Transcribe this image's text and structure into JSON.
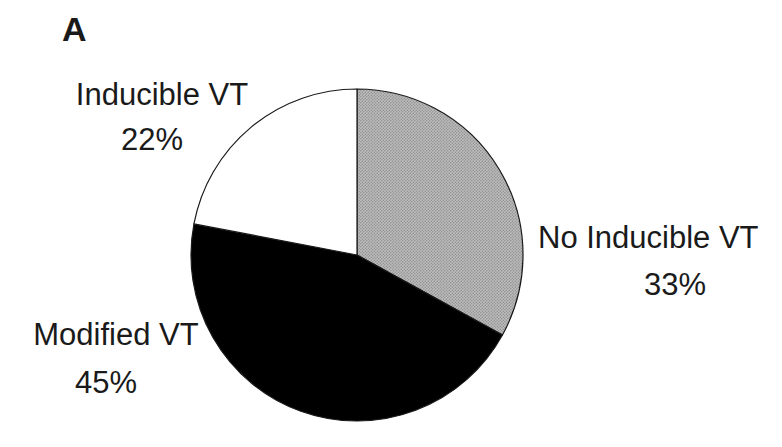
{
  "panel": {
    "label": "A"
  },
  "chart_data": {
    "type": "pie",
    "title": "",
    "direction": "clockwise",
    "start_angle_deg": 0,
    "slices": [
      {
        "label": "No Inducible VT",
        "value": 33,
        "pct_label": "33%",
        "color": "#b0b0b0",
        "fill_style": "stippled-gray"
      },
      {
        "label": "Modified VT",
        "value": 45,
        "pct_label": "45%",
        "color": "#000000",
        "fill_style": "solid-black"
      },
      {
        "label": "Inducible VT",
        "value": 22,
        "pct_label": "22%",
        "color": "#ffffff",
        "fill_style": "white"
      }
    ],
    "outline_color": "#1a1a1a",
    "legend_position": "outside-labels"
  }
}
